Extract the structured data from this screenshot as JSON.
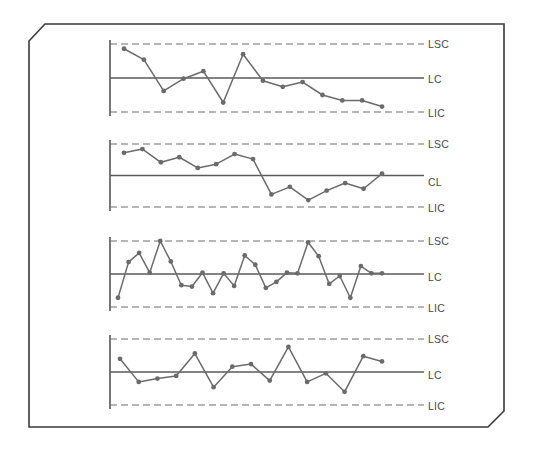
{
  "figure": {
    "title": "",
    "frame_style": "chamfered-rectangle",
    "background_color": "#ffffff",
    "line_color": "#6b6b6b",
    "border_color": "#3a3a3a"
  },
  "chart_data": [
    {
      "type": "line",
      "title": "",
      "xlabel": "",
      "ylabel": "",
      "ylim": [
        0,
        100
      ],
      "grid": false,
      "legend": "none",
      "annotations": [
        {
          "label": "LSC",
          "value": 100,
          "style": "dashed"
        },
        {
          "label": "LC",
          "value": 50,
          "style": "solid"
        },
        {
          "label": "LIC",
          "value": 0,
          "style": "dashed"
        }
      ],
      "x": [
        1,
        2,
        3,
        4,
        5,
        6,
        7,
        8,
        9,
        10,
        11,
        12,
        13,
        14,
        15,
        16,
        17,
        18
      ],
      "values": [
        93,
        77,
        31,
        49,
        60,
        14,
        85,
        46,
        37,
        44,
        25,
        17,
        17,
        8
      ]
    },
    {
      "type": "line",
      "title": "",
      "xlabel": "",
      "ylabel": "",
      "ylim": [
        0,
        100
      ],
      "grid": false,
      "legend": "none",
      "annotations": [
        {
          "label": "LSC",
          "value": 100,
          "style": "dashed"
        },
        {
          "label": "CL",
          "value": 50,
          "style": "solid"
        },
        {
          "label": "LIC",
          "value": 0,
          "style": "dashed"
        }
      ],
      "x": [
        1,
        2,
        3,
        4,
        5,
        6,
        7,
        8,
        9,
        10,
        11,
        12,
        13,
        14,
        15,
        16,
        17
      ],
      "values": [
        86,
        92,
        71,
        79,
        62,
        68,
        84,
        76,
        20,
        32,
        11,
        26,
        38,
        29,
        53
      ]
    },
    {
      "type": "line",
      "title": "",
      "xlabel": "",
      "ylabel": "",
      "ylim": [
        0,
        100
      ],
      "grid": false,
      "legend": "none",
      "annotations": [
        {
          "label": "LSC",
          "value": 100,
          "style": "dashed"
        },
        {
          "label": "LC",
          "value": 50,
          "style": "solid"
        },
        {
          "label": "LIC",
          "value": 0,
          "style": "dashed"
        }
      ],
      "x": [
        1,
        2,
        3,
        4,
        5,
        6,
        7,
        8,
        9,
        10,
        11,
        12,
        13,
        14,
        15,
        16,
        17,
        18,
        19,
        20,
        21,
        22,
        23,
        24,
        25,
        26,
        27,
        28,
        29,
        30
      ],
      "values": [
        14,
        68,
        82,
        52,
        100,
        69,
        33,
        31,
        52,
        21,
        51,
        32,
        78,
        64,
        29,
        38,
        52,
        51,
        98,
        77,
        35,
        47,
        14,
        62,
        51,
        51
      ]
    },
    {
      "type": "line",
      "title": "",
      "xlabel": "",
      "ylabel": "",
      "ylim": [
        0,
        100
      ],
      "grid": false,
      "legend": "none",
      "annotations": [
        {
          "label": "LSC",
          "value": 100,
          "style": "dashed"
        },
        {
          "label": "LC",
          "value": 50,
          "style": "solid"
        },
        {
          "label": "LIC",
          "value": 0,
          "style": "dashed"
        }
      ],
      "x": [
        1,
        2,
        3,
        4,
        5,
        6,
        7,
        8,
        9,
        10,
        11,
        12,
        13,
        14,
        15,
        16,
        17,
        18,
        19,
        20
      ],
      "values": [
        70,
        35,
        40,
        44,
        78,
        27,
        58,
        62,
        37,
        88,
        35,
        48,
        20,
        74,
        66
      ]
    }
  ],
  "labels": {
    "chart1": {
      "upper": "LSC",
      "center": "LC",
      "lower": "LIC"
    },
    "chart2": {
      "upper": "LSC",
      "center": "CL",
      "lower": "LIC"
    },
    "chart3": {
      "upper": "LSC",
      "center": "LC",
      "lower": "LIC"
    },
    "chart4": {
      "upper": "LSC",
      "center": "LC",
      "lower": "LIC"
    }
  }
}
